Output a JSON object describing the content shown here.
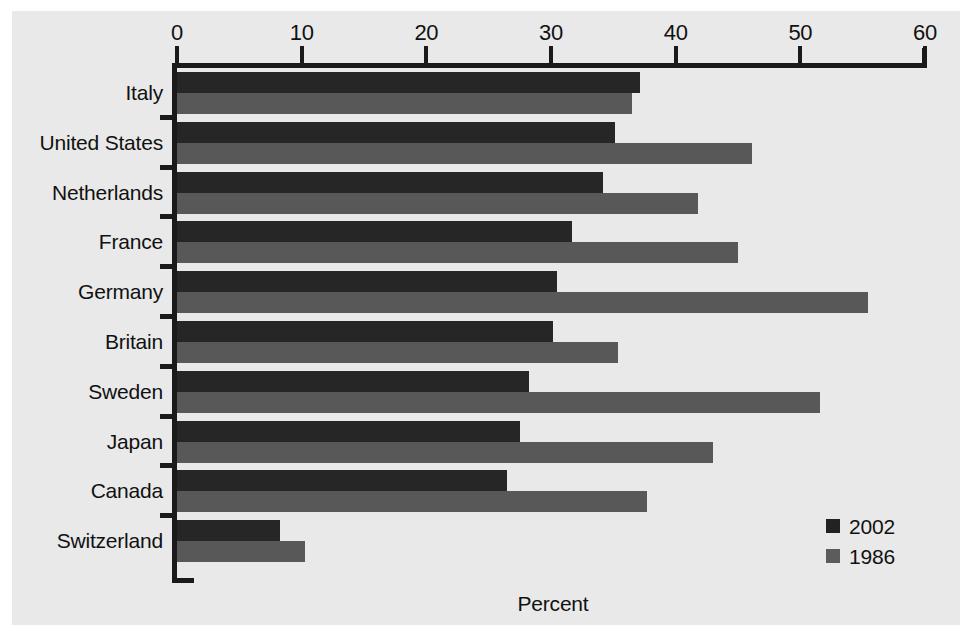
{
  "chart_data": {
    "type": "bar",
    "orientation": "horizontal",
    "title": "",
    "subtitle": "",
    "xlabel": "Percent",
    "ylabel": "",
    "xlim": [
      0,
      60
    ],
    "xticks": [
      0,
      10,
      20,
      30,
      40,
      50,
      60
    ],
    "xticklabels": [
      "0",
      "10",
      "20",
      "30",
      "40",
      "50",
      "60"
    ],
    "grid": false,
    "legend_position": "bottom-right",
    "categories": [
      "Italy",
      "United States",
      "Netherlands",
      "France",
      "Germany",
      "Britain",
      "Sweden",
      "Japan",
      "Canada",
      "Switzerland"
    ],
    "series": [
      {
        "name": "2002",
        "color": "#262626",
        "values": [
          37.1,
          35.1,
          34.2,
          31.7,
          30.5,
          30.2,
          28.2,
          27.5,
          26.5,
          8.3
        ]
      },
      {
        "name": "1986",
        "color": "#585858",
        "values": [
          36.5,
          46.1,
          41.8,
          45.0,
          55.4,
          35.4,
          51.6,
          43.0,
          37.7,
          10.3
        ]
      }
    ]
  },
  "legend": {
    "entries": [
      {
        "label": "2002",
        "swatch": "#222222"
      },
      {
        "label": "1986",
        "swatch": "#5c5c5c"
      }
    ]
  },
  "axis": {
    "x_title": "Percent"
  },
  "colors": {
    "panel_background": "#e9e9e9",
    "figure_background": "#ffffff",
    "axis": "#1a1a1a",
    "text": "#111111",
    "series_2002": "#262626",
    "series_1986": "#585858"
  }
}
